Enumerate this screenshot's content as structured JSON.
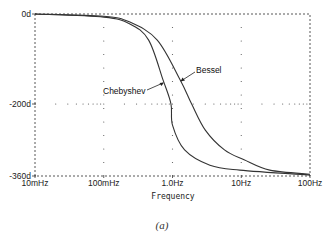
{
  "caption": "(a)",
  "chart_data": {
    "type": "line",
    "title": "",
    "xlabel": "Frequency",
    "ylabel": "",
    "xscale": "log",
    "xlim": [
      0.01,
      100
    ],
    "ylim": [
      -360,
      0
    ],
    "x_tick_labels": [
      "10mHz",
      "100mHz",
      "1.0Hz",
      "10Hz",
      "100Hz"
    ],
    "x_ticks": [
      0.01,
      0.1,
      1,
      10,
      100
    ],
    "y_tick_labels": [
      "0d",
      "-200d",
      "-360d"
    ],
    "y_ticks": [
      0,
      -200,
      -360
    ],
    "grid": "dotted",
    "legend": "annotations",
    "annotations": [
      {
        "text": "Chebyshev",
        "series": "Chebyshev"
      },
      {
        "text": "Bessel",
        "series": "Bessel"
      }
    ],
    "series": [
      {
        "name": "Chebyshev",
        "x": [
          0.01,
          0.1,
          0.24,
          0.45,
          0.73,
          0.95,
          1.0,
          1.5,
          3.5,
          9.5,
          100
        ],
        "y": [
          0,
          -7,
          -22,
          -58,
          -147,
          -200,
          -247,
          -302,
          -336,
          -347,
          -358
        ]
      },
      {
        "name": "Bessel",
        "x": [
          0.01,
          0.1,
          0.24,
          0.6,
          1.3,
          1.9,
          3.0,
          5.7,
          11,
          26,
          100
        ],
        "y": [
          0,
          -5,
          -18,
          -58,
          -147,
          -200,
          -258,
          -302,
          -324,
          -347,
          -356
        ]
      }
    ]
  }
}
